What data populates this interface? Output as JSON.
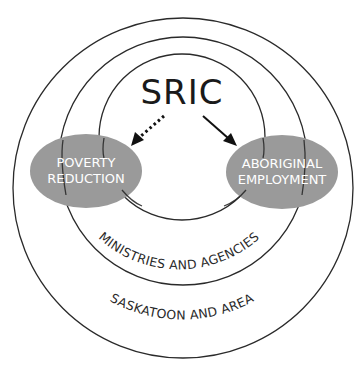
{
  "diagram": {
    "title": "SRIC",
    "rings": [
      {
        "name": "outer",
        "label": "SASKATOON AND AREA"
      },
      {
        "name": "middle",
        "label": "MINISTRIES AND AGENCIES"
      },
      {
        "name": "inner",
        "label": ""
      }
    ],
    "nodes": [
      {
        "id": "poverty",
        "lines": [
          "POVERTY",
          "REDUCTION"
        ]
      },
      {
        "id": "aboriginal",
        "lines": [
          "ABORIGINAL",
          "EMPLOYMENT"
        ]
      }
    ],
    "edges": [
      {
        "from": "SRIC",
        "to": "poverty",
        "style": "dotted"
      },
      {
        "from": "SRIC",
        "to": "aboriginal",
        "style": "solid"
      }
    ],
    "colors": {
      "ring_stroke": "#2a2a2a",
      "node_fill": "#9a9a9a",
      "node_text": "#ffffff",
      "arrow": "#111111"
    }
  }
}
